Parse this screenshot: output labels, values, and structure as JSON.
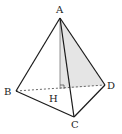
{
  "diagram": {
    "labels": {
      "A": "A",
      "B": "B",
      "C": "C",
      "D": "D",
      "H": "H"
    },
    "vertices": {
      "A": [
        60,
        18
      ],
      "B": [
        16,
        91
      ],
      "C": [
        74,
        117
      ],
      "D": [
        105,
        85
      ],
      "H": [
        60,
        89
      ]
    },
    "colors": {
      "edge": "#1a1a1a",
      "hidden": "#555555",
      "shade": "#d9d9d9"
    }
  }
}
